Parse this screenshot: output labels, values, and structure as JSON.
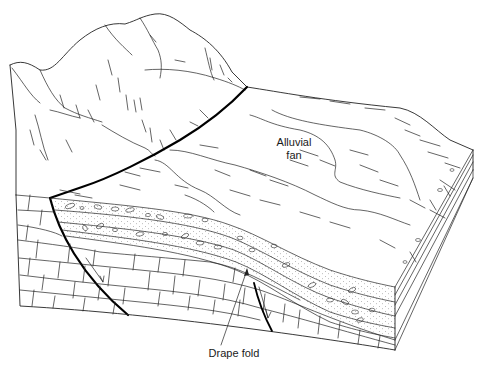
{
  "diagram": {
    "type": "geological-block-diagram",
    "labels": {
      "alluvial_fan_line1": "Alluvial",
      "alluvial_fan_line2": "fan",
      "drape_fold": "Drape fold"
    },
    "features": [
      {
        "name": "mountain-range",
        "description": "Upthrown footwall block with ridges"
      },
      {
        "name": "normal-fault-main",
        "description": "Bold fault trace across surface and section"
      },
      {
        "name": "normal-fault-secondary",
        "description": "Small fault with slip arrows in lower section"
      },
      {
        "name": "alluvial-fan",
        "description": "Fan deposit spreading from mountain front"
      },
      {
        "name": "conglomerate-layers",
        "description": "Dotted layers with pebbles above bedrock"
      },
      {
        "name": "bedrock-blocks",
        "description": "Brick-patterned limestone strata"
      },
      {
        "name": "drape-fold",
        "description": "Layers flexed over buried fault"
      }
    ],
    "colors": {
      "line": "#222222",
      "fault": "#000000",
      "background": "#ffffff"
    }
  }
}
